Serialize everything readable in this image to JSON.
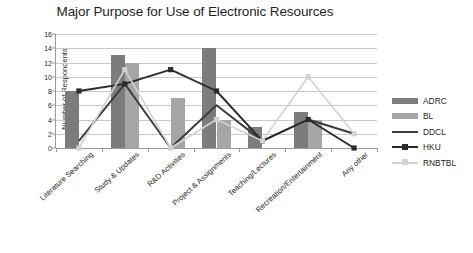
{
  "chart_data": {
    "type": "bar",
    "title": "Major Purpose for Use of Electronic Resources",
    "xlabel": "",
    "ylabel": "Number of Respondents",
    "ylim": [
      0,
      16
    ],
    "ytick_step": 2,
    "yticks": [
      0,
      2,
      4,
      6,
      8,
      10,
      12,
      14,
      16
    ],
    "grid": true,
    "legend_position": "right",
    "categories": [
      "Literature Searching",
      "Study & Updates",
      "R&D Activities",
      "Project & Assignments",
      "Teaching/Lectures",
      "Recreation/Entertainment",
      "Any other"
    ],
    "series": [
      {
        "name": "ADRC",
        "render": "bar",
        "color": "#7c7c7c",
        "values": [
          8,
          13,
          0,
          14,
          3,
          5,
          0
        ]
      },
      {
        "name": "BL",
        "render": "bar",
        "color": "#a6a6a6",
        "values": [
          0,
          12,
          7,
          4,
          0,
          4,
          0
        ]
      },
      {
        "name": "DDCL",
        "render": "line",
        "color": "#3b3b3b",
        "values": [
          1,
          9,
          0,
          6,
          1,
          4,
          2
        ]
      },
      {
        "name": "HKU",
        "render": "line",
        "color": "#2b2b2b",
        "marker": "square",
        "values": [
          8,
          9,
          11,
          8,
          1,
          4,
          0
        ]
      },
      {
        "name": "RNBTBL",
        "render": "line",
        "color": "#d2d2d2",
        "marker": "square",
        "values": [
          0,
          11,
          0,
          4,
          1,
          10,
          2
        ]
      }
    ]
  },
  "legend": {
    "items": [
      {
        "label": "ADRC"
      },
      {
        "label": "BL"
      },
      {
        "label": "DDCL"
      },
      {
        "label": "HKU"
      },
      {
        "label": "RNBTBL"
      }
    ]
  }
}
